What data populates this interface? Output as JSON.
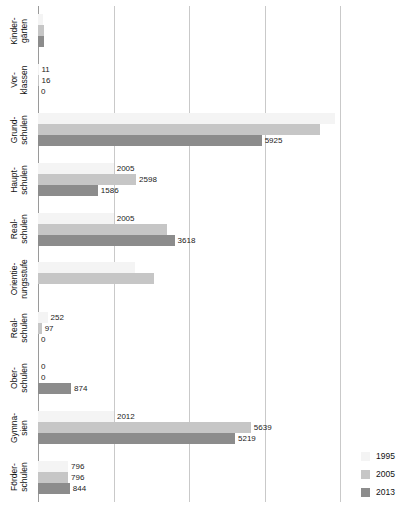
{
  "chart_data": {
    "type": "bar",
    "orientation": "horizontal",
    "title": "",
    "subtitle": "",
    "xlabel": "",
    "ylabel": "",
    "grid": true,
    "legend_position": "bottom-right",
    "xlim": [
      0,
      8000
    ],
    "gridline_values": [
      0,
      2000,
      4000,
      6000,
      8000
    ],
    "categories": [
      "Kinder-\ngärten",
      "Vor-\nklassen",
      "Grund-\nschulen",
      "Haupt-\nschulen",
      "Real-\nschulen",
      "Orientie-\nrungsstufe",
      "Real-\nschulen",
      "Ober-\nschulen",
      "Gymna-\nsien",
      "Förder-\nschulen"
    ],
    "category_lines": [
      [
        "Kinder-",
        "gärten"
      ],
      [
        "Vor-",
        "klassen"
      ],
      [
        "Grund-",
        "schulen"
      ],
      [
        "Haupt-",
        "schulen"
      ],
      [
        "Real-",
        "schulen"
      ],
      [
        "Orientie-",
        "rungsstufe"
      ],
      [
        "Real-",
        "schulen"
      ],
      [
        "Ober-",
        "schulen"
      ],
      [
        "Gymna-",
        "sien"
      ],
      [
        "Förder-",
        "schulen"
      ]
    ],
    "series": [
      {
        "name": "1995",
        "color": "#f4f4f4",
        "values": [
          130,
          11,
          7880,
          2005,
          2005,
          2580,
          252,
          0,
          2012,
          796
        ],
        "labels": [
          "",
          "11",
          "",
          "2005",
          "2005",
          "",
          "252",
          "0",
          "2012",
          "796"
        ]
      },
      {
        "name": "2005",
        "color": "#c6c6c6",
        "values": [
          150,
          16,
          7480,
          2598,
          3420,
          3080,
          97,
          0,
          5639,
          796
        ],
        "labels": [
          "",
          "16",
          "",
          "2598",
          "",
          "",
          "97",
          "0",
          "5639",
          "796"
        ]
      },
      {
        "name": "2013",
        "color": "#8c8c8c",
        "values": [
          170,
          0,
          5925,
          1586,
          3618,
          0,
          0,
          874,
          5219,
          844
        ],
        "labels": [
          "",
          "0",
          "5925",
          "1586",
          "3618",
          "",
          "0",
          "874",
          "5219",
          "844"
        ]
      }
    ]
  },
  "legend": {
    "entries": [
      {
        "label": "1995",
        "color": "#f4f4f4"
      },
      {
        "label": "2005",
        "color": "#c6c6c6"
      },
      {
        "label": "2013",
        "color": "#8c8c8c"
      }
    ]
  }
}
